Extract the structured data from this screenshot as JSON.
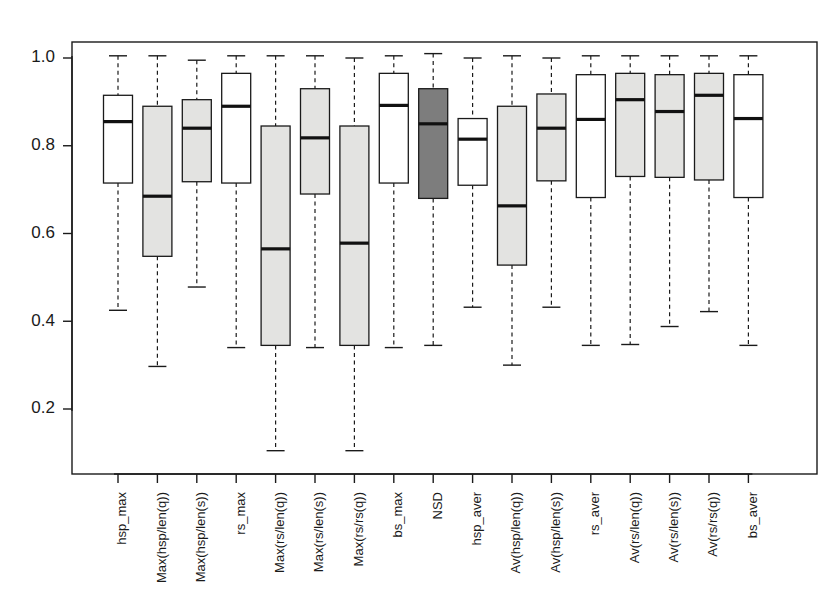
{
  "chart_data": {
    "type": "box",
    "title": "",
    "xlabel": "",
    "ylabel": "",
    "ylim": [
      0.06,
      1.04
    ],
    "grid": false,
    "legend": null,
    "yticks": [
      "1.0",
      "0.8",
      "0.6",
      "0.4",
      "0.2"
    ],
    "ytick_values": [
      1.0,
      0.8,
      0.6,
      0.4,
      0.2
    ],
    "categories": [
      "hsp_max",
      "Max(hsp/len(q))",
      "Max(hsp/len(s))",
      "rs_max",
      "Max(rs/len(q))",
      "Max(rs/len(s))",
      "Max(rs/rs(q))",
      "bs_max",
      "NSD",
      "hsp_aver",
      "Av(hsp/len(q))",
      "Av(hsp/len(s))",
      "rs_aver",
      "Av(rs/len(q))",
      "Av(rs/len(s))",
      "Av(rs/rs(q))",
      "bs_aver"
    ],
    "fill_colors": {
      "white": "#ffffff",
      "light_gray": "#e3e3e1",
      "dark_gray": "#7d7d7d",
      "outline": "#1a1a1a"
    },
    "boxes": [
      {
        "label": "hsp_max",
        "whisker_low": 0.425,
        "q1": 0.715,
        "median": 0.855,
        "q3": 0.915,
        "whisker_high": 1.005,
        "fill": "white"
      },
      {
        "label": "Max(hsp/len(q))",
        "whisker_low": 0.297,
        "q1": 0.548,
        "median": 0.685,
        "q3": 0.89,
        "whisker_high": 1.005,
        "fill": "light_gray"
      },
      {
        "label": "Max(hsp/len(s))",
        "whisker_low": 0.478,
        "q1": 0.718,
        "median": 0.84,
        "q3": 0.905,
        "whisker_high": 0.995,
        "fill": "light_gray"
      },
      {
        "label": "rs_max",
        "whisker_low": 0.34,
        "q1": 0.715,
        "median": 0.89,
        "q3": 0.965,
        "whisker_high": 1.005,
        "fill": "white"
      },
      {
        "label": "Max(rs/len(q))",
        "whisker_low": 0.105,
        "q1": 0.345,
        "median": 0.565,
        "q3": 0.845,
        "whisker_high": 1.005,
        "fill": "light_gray"
      },
      {
        "label": "Max(rs/len(s))",
        "whisker_low": 0.34,
        "q1": 0.69,
        "median": 0.818,
        "q3": 0.93,
        "whisker_high": 1.005,
        "fill": "light_gray"
      },
      {
        "label": "Max(rs/rs(q))",
        "whisker_low": 0.105,
        "q1": 0.345,
        "median": 0.578,
        "q3": 0.845,
        "whisker_high": 1.0,
        "fill": "light_gray"
      },
      {
        "label": "bs_max",
        "whisker_low": 0.34,
        "q1": 0.715,
        "median": 0.892,
        "q3": 0.965,
        "whisker_high": 1.005,
        "fill": "white"
      },
      {
        "label": "NSD",
        "whisker_low": 0.345,
        "q1": 0.68,
        "median": 0.85,
        "q3": 0.93,
        "whisker_high": 1.01,
        "fill": "dark_gray"
      },
      {
        "label": "hsp_aver",
        "whisker_low": 0.432,
        "q1": 0.71,
        "median": 0.815,
        "q3": 0.862,
        "whisker_high": 1.0,
        "fill": "white"
      },
      {
        "label": "Av(hsp/len(q))",
        "whisker_low": 0.3,
        "q1": 0.528,
        "median": 0.663,
        "q3": 0.89,
        "whisker_high": 1.005,
        "fill": "light_gray"
      },
      {
        "label": "Av(hsp/len(s))",
        "whisker_low": 0.432,
        "q1": 0.72,
        "median": 0.84,
        "q3": 0.918,
        "whisker_high": 1.0,
        "fill": "light_gray"
      },
      {
        "label": "rs_aver",
        "whisker_low": 0.345,
        "q1": 0.682,
        "median": 0.86,
        "q3": 0.962,
        "whisker_high": 1.005,
        "fill": "white"
      },
      {
        "label": "Av(rs/len(q))",
        "whisker_low": 0.347,
        "q1": 0.73,
        "median": 0.905,
        "q3": 0.965,
        "whisker_high": 1.005,
        "fill": "light_gray"
      },
      {
        "label": "Av(rs/len(s))",
        "whisker_low": 0.388,
        "q1": 0.728,
        "median": 0.878,
        "q3": 0.962,
        "whisker_high": 1.005,
        "fill": "light_gray"
      },
      {
        "label": "Av(rs/rs(q))",
        "whisker_low": 0.422,
        "q1": 0.722,
        "median": 0.915,
        "q3": 0.965,
        "whisker_high": 1.005,
        "fill": "light_gray"
      },
      {
        "label": "bs_aver",
        "whisker_low": 0.345,
        "q1": 0.682,
        "median": 0.862,
        "q3": 0.962,
        "whisker_high": 1.005,
        "fill": "white"
      }
    ]
  }
}
